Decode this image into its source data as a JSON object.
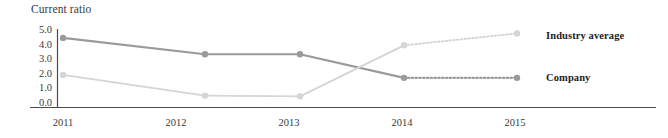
{
  "chart_data": {
    "type": "line",
    "title": "Current ratio",
    "xlabel": "",
    "ylabel": "Current ratio",
    "categories": [
      "2011",
      "2012",
      "2013",
      "2014",
      "2015"
    ],
    "x": [
      2011,
      2012,
      2013,
      2014,
      2015
    ],
    "ylim": [
      0.0,
      5.0
    ],
    "ytick_labels": [
      "5.0",
      "4.0",
      "3.0",
      "2.0",
      "1.0",
      "0.0"
    ],
    "ytick_values": [
      5.0,
      4.0,
      3.0,
      2.0,
      1.0,
      0.0
    ],
    "grid": false,
    "legend_position": "right",
    "series": [
      {
        "name": "Company",
        "values": [
          4.5,
          3.4,
          3.4,
          1.8,
          1.8
        ],
        "color": "#9a9a9a",
        "marker": "circle",
        "line_style_solid_through": "2014",
        "line_style_after_2014": "dotted"
      },
      {
        "name": "Industry average",
        "values": [
          2.0,
          0.6,
          0.55,
          4.0,
          4.8
        ],
        "color": "#d5d5d5",
        "marker": "circle",
        "line_style_solid_through": "2014",
        "line_style_after_2014": "dotted"
      }
    ],
    "annotations": [
      "Series cross between 2013 and 2014",
      "Segments from 2014 to 2015 drawn dotted"
    ]
  },
  "legend": {
    "industry_average": "Industry average",
    "company": "Company"
  },
  "axes": {
    "title": "Current ratio",
    "axis_color": "#4a4a4a"
  }
}
